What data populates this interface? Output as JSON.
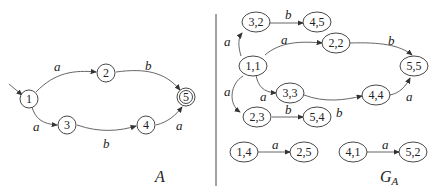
{
  "automaton_A": {
    "caption": "A",
    "states": [
      {
        "id": "1",
        "label": "1",
        "initial": true
      },
      {
        "id": "2",
        "label": "2"
      },
      {
        "id": "3",
        "label": "3"
      },
      {
        "id": "4",
        "label": "4"
      },
      {
        "id": "5",
        "label": "5",
        "final": true
      }
    ],
    "transitions": [
      {
        "from": "1",
        "to": "2",
        "label": "a"
      },
      {
        "from": "2",
        "to": "5",
        "label": "b"
      },
      {
        "from": "1",
        "to": "3",
        "label": "a"
      },
      {
        "from": "3",
        "to": "4",
        "label": "b"
      },
      {
        "from": "4",
        "to": "5",
        "label": "a"
      }
    ]
  },
  "graph_GA": {
    "caption": "G",
    "caption_sub": "A",
    "nodes": [
      "3,2",
      "4,5",
      "1,1",
      "2,2",
      "5,5",
      "3,3",
      "4,4",
      "2,3",
      "5,4",
      "1,4",
      "2,5",
      "4,1",
      "5,2"
    ],
    "edges": [
      {
        "from": "3,2",
        "to": "4,5",
        "label": "b"
      },
      {
        "from": "1,1",
        "to": "3,2",
        "label": "a"
      },
      {
        "from": "1,1",
        "to": "2,2",
        "label": "a"
      },
      {
        "from": "2,2",
        "to": "5,5",
        "label": "b"
      },
      {
        "from": "1,1",
        "to": "3,3",
        "label": "a"
      },
      {
        "from": "3,3",
        "to": "4,4",
        "label": "b"
      },
      {
        "from": "4,4",
        "to": "5,5",
        "label": "a"
      },
      {
        "from": "1,1",
        "to": "2,3",
        "label": "a"
      },
      {
        "from": "2,3",
        "to": "5,4",
        "label": "b"
      },
      {
        "from": "1,4",
        "to": "2,5",
        "label": "a"
      },
      {
        "from": "4,1",
        "to": "5,2",
        "label": "a"
      }
    ]
  }
}
